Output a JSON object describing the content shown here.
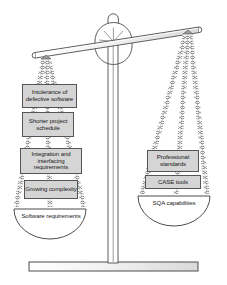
{
  "diagram": {
    "type": "balance-scale",
    "tilt": "left-side-down",
    "colors": {
      "background": "#ffffff",
      "box_fill": "#d5d5d5",
      "outline": "#555555",
      "chain": "#8a8a8a",
      "text": "#1a1a1a"
    }
  },
  "left_pan": {
    "name": "software-requirements-pan",
    "state": "down",
    "pan_label": "Software requirements",
    "boxes": [
      {
        "label": "Intolerance of defective software"
      },
      {
        "label": "Shorter project schedule"
      },
      {
        "label": "Integration and interfacing requirements"
      },
      {
        "label": "Growing complexity"
      }
    ]
  },
  "right_pan": {
    "name": "sqa-capabilities-pan",
    "state": "up",
    "pan_label": "SQA capabilities",
    "boxes": [
      {
        "label": "Professional standards"
      },
      {
        "label": "CASE tools"
      }
    ]
  },
  "frame": {
    "beam": "beam",
    "fulcrum": "fulcrum",
    "post": "center-post",
    "base": "base-plate"
  }
}
